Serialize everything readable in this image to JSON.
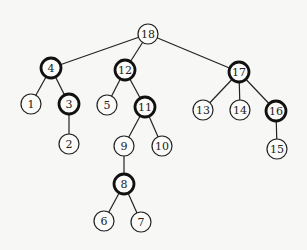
{
  "diagram": {
    "type": "tree",
    "root": "18",
    "colors": {
      "edge": "#222222",
      "node_fill": "#fbfbf9",
      "node_stroke": "#222222",
      "background": "#f7f7f5"
    },
    "nodes": [
      {
        "id": "18",
        "label": "18",
        "x": 148,
        "y": 34,
        "bold": false
      },
      {
        "id": "4",
        "label": "4",
        "x": 51,
        "y": 68,
        "bold": true
      },
      {
        "id": "12",
        "label": "12",
        "x": 125,
        "y": 70,
        "bold": true
      },
      {
        "id": "17",
        "label": "17",
        "x": 239,
        "y": 72,
        "bold": true
      },
      {
        "id": "1",
        "label": "1",
        "x": 31,
        "y": 104,
        "bold": false
      },
      {
        "id": "3",
        "label": "3",
        "x": 69,
        "y": 104,
        "bold": true
      },
      {
        "id": "2",
        "label": "2",
        "x": 69,
        "y": 144,
        "bold": false
      },
      {
        "id": "5",
        "label": "5",
        "x": 107,
        "y": 105,
        "bold": false
      },
      {
        "id": "11",
        "label": "11",
        "x": 145,
        "y": 107,
        "bold": true
      },
      {
        "id": "9",
        "label": "9",
        "x": 124,
        "y": 146,
        "bold": false
      },
      {
        "id": "10",
        "label": "10",
        "x": 162,
        "y": 146,
        "bold": false
      },
      {
        "id": "8",
        "label": "8",
        "x": 124,
        "y": 184,
        "bold": true
      },
      {
        "id": "6",
        "label": "6",
        "x": 104,
        "y": 221,
        "bold": false
      },
      {
        "id": "7",
        "label": "7",
        "x": 141,
        "y": 222,
        "bold": false
      },
      {
        "id": "13",
        "label": "13",
        "x": 203,
        "y": 110,
        "bold": false
      },
      {
        "id": "14",
        "label": "14",
        "x": 240,
        "y": 110,
        "bold": false
      },
      {
        "id": "16",
        "label": "16",
        "x": 276,
        "y": 111,
        "bold": true
      },
      {
        "id": "15",
        "label": "15",
        "x": 277,
        "y": 149,
        "bold": false
      }
    ],
    "edges": [
      [
        "18",
        "4"
      ],
      [
        "18",
        "12"
      ],
      [
        "18",
        "17"
      ],
      [
        "4",
        "1"
      ],
      [
        "4",
        "3"
      ],
      [
        "3",
        "2"
      ],
      [
        "12",
        "5"
      ],
      [
        "12",
        "11"
      ],
      [
        "11",
        "9"
      ],
      [
        "11",
        "10"
      ],
      [
        "9",
        "8"
      ],
      [
        "8",
        "6"
      ],
      [
        "8",
        "7"
      ],
      [
        "17",
        "13"
      ],
      [
        "17",
        "14"
      ],
      [
        "17",
        "16"
      ],
      [
        "16",
        "15"
      ]
    ]
  }
}
